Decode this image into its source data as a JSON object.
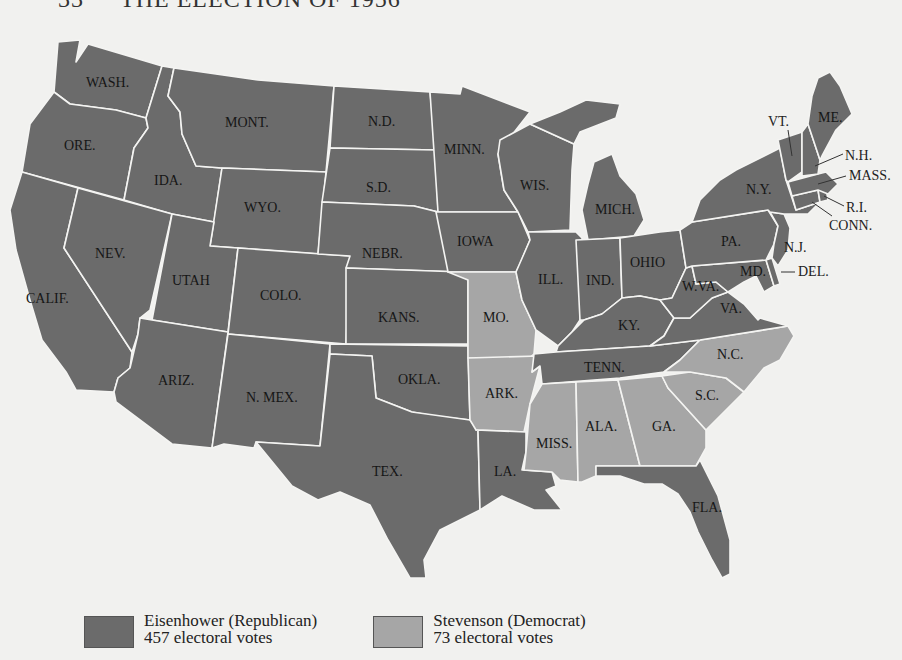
{
  "title": {
    "number": "33",
    "text": "THE ELECTION OF 1956"
  },
  "colors": {
    "republican": "#6b6b6b",
    "democrat": "#a6a6a6",
    "background": "#f1f1ef",
    "border": "#f4f4f2"
  },
  "legend": [
    {
      "party": "Eisenhower (Republican)",
      "votes": "457 electoral votes",
      "color": "#6b6b6b"
    },
    {
      "party": "Stevenson (Democrat)",
      "votes": "73 electoral votes",
      "color": "#a6a6a6"
    }
  ],
  "states": {
    "wash": "WASH.",
    "ore": "ORE.",
    "calif": "CALIF.",
    "ida": "IDA.",
    "nev": "NEV.",
    "mont": "MONT.",
    "wyo": "WYO.",
    "utah": "UTAH",
    "colo": "COLO.",
    "ariz": "ARIZ.",
    "nmex": "N. MEX.",
    "nd": "N.D.",
    "sd": "S.D.",
    "nebr": "NEBR.",
    "kans": "KANS.",
    "okla": "OKLA.",
    "tex": "TEX.",
    "minn": "MINN.",
    "iowa": "IOWA",
    "mo": "MO.",
    "ark": "ARK.",
    "la": "LA.",
    "wis": "WIS.",
    "ill": "ILL.",
    "mich": "MICH.",
    "ind": "IND.",
    "ohio": "OHIO",
    "ky": "KY.",
    "tenn": "TENN.",
    "miss": "MISS.",
    "ala": "ALA.",
    "ga": "GA.",
    "fla": "FLA.",
    "sc": "S.C.",
    "nc": "N.C.",
    "va": "VA.",
    "wva": "W.VA.",
    "md": "MD.",
    "del": "DEL.",
    "pa": "PA.",
    "nj": "N.J.",
    "ny": "N.Y.",
    "conn": "CONN.",
    "ri": "R.I.",
    "mass": "MASS.",
    "vt": "VT.",
    "nh": "N.H.",
    "me": "ME."
  },
  "results": {
    "democrat_states": [
      "MO.",
      "ARK.",
      "MISS.",
      "ALA.",
      "GA.",
      "S.C.",
      "N.C."
    ],
    "republican_states": [
      "WASH.",
      "ORE.",
      "CALIF.",
      "IDA.",
      "NEV.",
      "MONT.",
      "WYO.",
      "UTAH",
      "COLO.",
      "ARIZ.",
      "N. MEX.",
      "N.D.",
      "S.D.",
      "NEBR.",
      "KANS.",
      "OKLA.",
      "TEX.",
      "MINN.",
      "IOWA",
      "LA.",
      "WIS.",
      "ILL.",
      "MICH.",
      "IND.",
      "OHIO",
      "KY.",
      "TENN.",
      "FLA.",
      "VA.",
      "W.VA.",
      "MD.",
      "DEL.",
      "PA.",
      "N.J.",
      "N.Y.",
      "CONN.",
      "R.I.",
      "MASS.",
      "VT.",
      "N.H.",
      "ME."
    ]
  }
}
